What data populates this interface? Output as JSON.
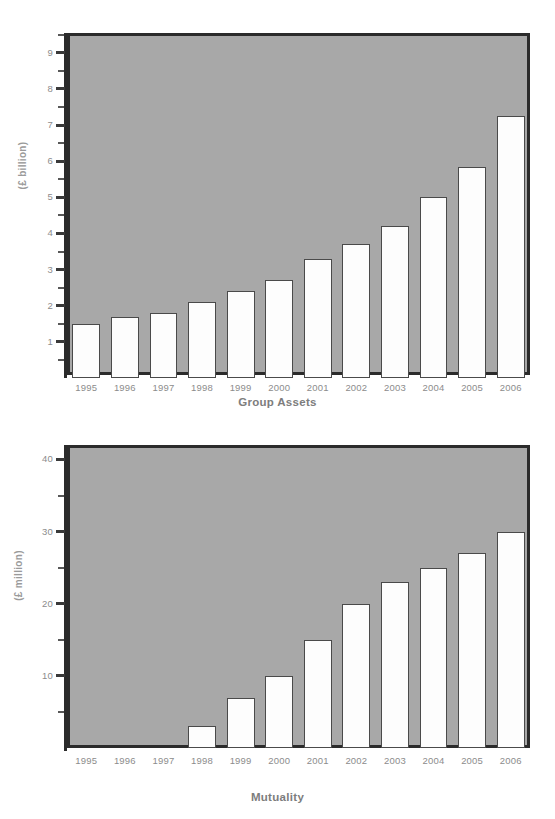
{
  "page": {
    "background_color": "#ffffff",
    "plot_background_color": "#a8a8a8",
    "bar_fill_color": "#fdfdfd",
    "bar_border_color": "#4a4a4a",
    "frame_color": "#2b2b2b",
    "label_color": "#8c8c8c",
    "title_color": "#7d7d7d"
  },
  "charts": [
    {
      "id": "group-assets",
      "title": "Group Assets",
      "ylabel": "(£ billion)",
      "categories": [
        "1995",
        "1996",
        "1997",
        "1998",
        "1999",
        "2000",
        "2001",
        "2002",
        "2003",
        "2004",
        "2005",
        "2006"
      ],
      "values": [
        1.5,
        1.7,
        1.8,
        2.1,
        2.4,
        2.7,
        3.3,
        3.7,
        4.2,
        5.0,
        5.85,
        7.25
      ],
      "ylim": [
        0,
        9.55
      ],
      "ytick_major": [
        1,
        2,
        3,
        4,
        5,
        6,
        7,
        8,
        9
      ],
      "ytick_minor": [
        0.5,
        1.5,
        2.5,
        3.5,
        4.5,
        5.5,
        6.5,
        7.5,
        8.5,
        9.5
      ],
      "ytick_labels": [
        "1",
        "2",
        "3",
        "4",
        "5",
        "6",
        "7",
        "8",
        "9"
      ]
    },
    {
      "id": "mutuality",
      "title": "Mutuality",
      "ylabel": "(£ million)",
      "categories": [
        "1995",
        "1996",
        "1997",
        "1998",
        "1999",
        "2000",
        "2001",
        "2002",
        "2003",
        "2004",
        "2005",
        "2006"
      ],
      "values": [
        0,
        0,
        0,
        3,
        7,
        10,
        15,
        20,
        23,
        25,
        27,
        30
      ],
      "ylim": [
        0,
        42
      ],
      "ytick_major": [
        10,
        20,
        30,
        40
      ],
      "ytick_minor": [
        5,
        15,
        25,
        35
      ],
      "ytick_labels": [
        "10",
        "20",
        "30",
        "40"
      ]
    }
  ],
  "chart_data": [
    {
      "type": "bar",
      "title": "Group Assets",
      "xlabel": "",
      "ylabel": "(£ billion)",
      "categories": [
        "1995",
        "1996",
        "1997",
        "1998",
        "1999",
        "2000",
        "2001",
        "2002",
        "2003",
        "2004",
        "2005",
        "2006"
      ],
      "values": [
        1.5,
        1.7,
        1.8,
        2.1,
        2.4,
        2.7,
        3.3,
        3.7,
        4.2,
        5.0,
        5.85,
        7.25
      ],
      "ylim": [
        0,
        9.55
      ],
      "ytick_labels": [
        "1",
        "2",
        "3",
        "4",
        "5",
        "6",
        "7",
        "8",
        "9"
      ],
      "grid": false,
      "legend": "none"
    },
    {
      "type": "bar",
      "title": "Mutuality",
      "xlabel": "",
      "ylabel": "(£ million)",
      "categories": [
        "1995",
        "1996",
        "1997",
        "1998",
        "1999",
        "2000",
        "2001",
        "2002",
        "2003",
        "2004",
        "2005",
        "2006"
      ],
      "values": [
        0,
        0,
        0,
        3,
        7,
        10,
        15,
        20,
        23,
        25,
        27,
        30
      ],
      "ylim": [
        0,
        42
      ],
      "ytick_labels": [
        "10",
        "20",
        "30",
        "40"
      ],
      "grid": false,
      "legend": "none"
    }
  ]
}
